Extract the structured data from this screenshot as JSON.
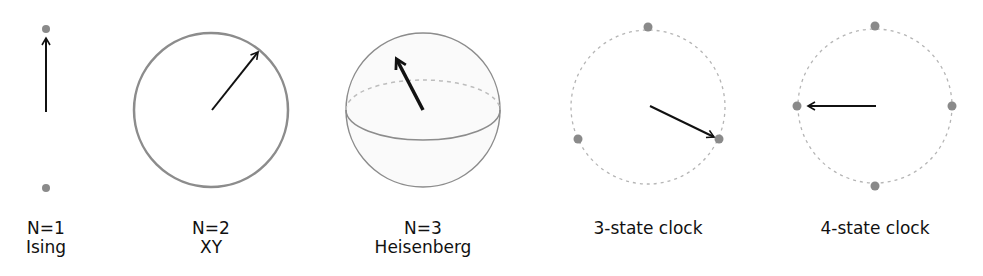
{
  "figure": {
    "colors": {
      "arrow": "#111111",
      "circle": "#8c8c8c",
      "dashed": "#b5b5b5",
      "dot": "#8a8a8a",
      "background": "#ffffff"
    },
    "panels": [
      {
        "id": "ising",
        "line1": "N=1",
        "line2": "Ising",
        "type": "two-state",
        "arrow_direction": "up"
      },
      {
        "id": "xy",
        "line1": "N=2",
        "line2": "XY",
        "type": "circle",
        "arrow_angle_deg": 50
      },
      {
        "id": "heisenberg",
        "line1": "N=3",
        "line2": "Heisenberg",
        "type": "sphere",
        "arrow_direction": "up-left"
      },
      {
        "id": "clock3",
        "line1": "3-state clock",
        "line2": "",
        "type": "discrete-circle",
        "states": 3,
        "arrow_to": "lower-right state"
      },
      {
        "id": "clock4",
        "line1": "4-state clock",
        "line2": "",
        "type": "discrete-circle",
        "states": 4,
        "arrow_to": "left state"
      }
    ]
  }
}
